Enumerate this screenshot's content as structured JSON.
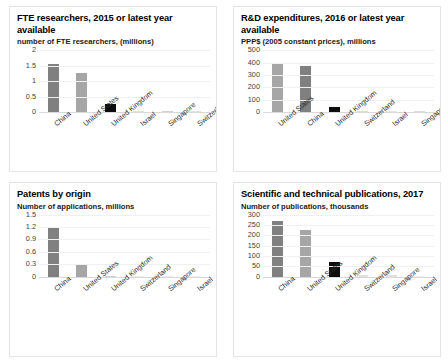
{
  "page": {
    "background": "#ffffff",
    "layout": "2x2 grid of bar charts"
  },
  "palette": {
    "bar_dark_gray": "#808080",
    "bar_light_gray": "#a6a6a6",
    "bar_black": "#0d0d0d",
    "bar_pale": "#d9d9d9",
    "gridline": "#f0f0f0",
    "axis": "#d9d9d9",
    "text": "#000000"
  },
  "charts": [
    {
      "id": "fte-researchers",
      "title": "FTE researchers, 2015 or latest year available",
      "subtitle": "number of FTE researchers, (millions)",
      "chart_data": {
        "type": "bar",
        "title": "FTE researchers, 2015 or latest year available",
        "ylabel": "number of FTE researchers, (millions)",
        "xlabel": "",
        "categories": [
          "China",
          "United States",
          "United Kingdom",
          "Israel",
          "Singapore",
          "Switzerland"
        ],
        "values": [
          1.55,
          1.25,
          0.28,
          0.02,
          0.03,
          0.02
        ],
        "colors": [
          "#808080",
          "#a6a6a6",
          "#0d0d0d",
          "#e2e2e2",
          "#d0d0d0",
          "#e2e2e2"
        ],
        "ylim": [
          0,
          2
        ],
        "yticks": [
          "0",
          "0.5",
          "1",
          "1.5",
          "2"
        ],
        "ytick_values": [
          0,
          0.5,
          1,
          1.5,
          2
        ],
        "grid": true,
        "legend": "none"
      }
    },
    {
      "id": "rd-expenditures",
      "title": "R&D expenditures, 2016 or latest year available",
      "subtitle": "PPP$ (2005 constant prices), millions",
      "chart_data": {
        "type": "bar",
        "title": "R&D expenditures, 2016 or latest year available",
        "ylabel": "PPP$ (2005 constant prices), millions",
        "xlabel": "",
        "categories": [
          "United States",
          "China",
          "United Kingdom",
          "Switzerland",
          "Israel",
          "Singapore"
        ],
        "values": [
          400,
          375,
          40,
          12,
          8,
          7
        ],
        "colors": [
          "#a6a6a6",
          "#808080",
          "#0d0d0d",
          "#dcdcdc",
          "#e6e6e6",
          "#dcdcdc"
        ],
        "ylim": [
          0,
          500
        ],
        "yticks": [
          "0",
          "100",
          "200",
          "300",
          "400",
          "500"
        ],
        "ytick_values": [
          0,
          100,
          200,
          300,
          400,
          500
        ],
        "grid": true,
        "legend": "none"
      }
    },
    {
      "id": "patents-by-origin",
      "title": "Patents by origin",
      "subtitle": "Number of applications, millions",
      "chart_data": {
        "type": "bar",
        "title": "Patents by origin",
        "ylabel": "Number of applications, millions",
        "xlabel": "",
        "categories": [
          "China",
          "United States",
          "United Kingdom",
          "Switzerland",
          "Singapore",
          "Israel"
        ],
        "values": [
          1.2,
          0.28,
          0.02,
          0.005,
          0.004,
          0.004
        ],
        "colors": [
          "#808080",
          "#a6a6a6",
          "#cfcfcf",
          "#ededed",
          "#ededed",
          "#ededed"
        ],
        "ylim": [
          0,
          1.5
        ],
        "yticks": [
          "0",
          "0.3",
          "0.6",
          "0.9",
          "1.2",
          "1.5"
        ],
        "ytick_values": [
          0,
          0.3,
          0.6,
          0.9,
          1.2,
          1.5
        ],
        "grid": true,
        "legend": "none"
      }
    },
    {
      "id": "scientific-publications",
      "title": "Scientific and technical publications, 2017",
      "subtitle": "Number of publications, thousands",
      "chart_data": {
        "type": "bar",
        "title": "Scientific and technical publications, 2017",
        "ylabel": "Number of publications, thousands",
        "xlabel": "",
        "categories": [
          "China",
          "United States",
          "United Kingdom",
          "Switzerland",
          "Singapore",
          "Israel"
        ],
        "values": [
          270,
          225,
          72,
          8,
          6,
          4
        ],
        "colors": [
          "#808080",
          "#a6a6a6",
          "#0d0d0d",
          "#e0e0e0",
          "#e0e0e0",
          "#ededed"
        ],
        "ylim": [
          0,
          300
        ],
        "yticks": [
          "0",
          "50",
          "100",
          "150",
          "200",
          "250",
          "300"
        ],
        "ytick_values": [
          0,
          50,
          100,
          150,
          200,
          250,
          300
        ],
        "grid": true,
        "legend": "none"
      }
    }
  ]
}
